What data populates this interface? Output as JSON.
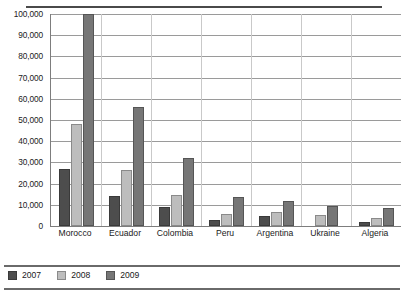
{
  "chart_data": {
    "type": "bar",
    "title": "",
    "xlabel": "",
    "ylabel": "",
    "ylim": [
      0,
      100000
    ],
    "ytick_labels": [
      "100,000",
      "90,000",
      "80,000",
      "70,000",
      "60,000",
      "50,000",
      "40,000",
      "30,000",
      "20,000",
      "10,000",
      "0"
    ],
    "yticks": [
      100000,
      90000,
      80000,
      70000,
      60000,
      50000,
      40000,
      30000,
      20000,
      10000,
      0
    ],
    "grid": true,
    "legend_position": "bottom-left",
    "categories": [
      "Morocco",
      "Ecuador",
      "Colombia",
      "Peru",
      "Argentina",
      "Ukraine",
      "Algeria"
    ],
    "series": [
      {
        "name": "2007",
        "color": "#4d4d4d",
        "values": [
          27000,
          14000,
          8800,
          3000,
          4500,
          0,
          2000
        ]
      },
      {
        "name": "2008",
        "color": "#bdbdbd",
        "values": [
          48000,
          26500,
          14800,
          5500,
          6500,
          5000,
          4000
        ]
      },
      {
        "name": "2009",
        "color": "#767676",
        "values": [
          100000,
          56000,
          32000,
          13500,
          12000,
          9500,
          8500
        ]
      }
    ]
  }
}
